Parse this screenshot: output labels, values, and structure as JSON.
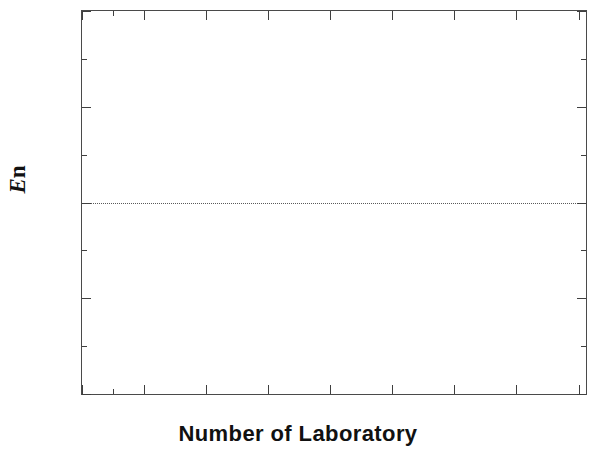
{
  "chart_data": {
    "type": "scatter",
    "title": "",
    "xlabel": "Number of Laboratory",
    "ylabel": "En",
    "ylabel_parts": {
      "italic": "E",
      "upright": "n"
    },
    "x": [
      1,
      2,
      3,
      4,
      5,
      6,
      7,
      8
    ],
    "values": [
      0.33,
      0.76,
      -0.03,
      -0.36,
      0.32,
      -0.35,
      -0.64,
      0.04
    ],
    "series": [
      {
        "name": "En",
        "x": [
          1,
          2,
          3,
          4,
          5,
          6,
          7,
          8
        ],
        "values": [
          0.33,
          0.76,
          -0.03,
          -0.36,
          0.32,
          -0.35,
          -0.64,
          0.04
        ]
      }
    ],
    "xlim": [
      0,
      8.12
    ],
    "ylim": [
      -1.0,
      1.0
    ],
    "xticks": [
      0,
      1,
      2,
      3,
      4,
      5,
      6,
      7,
      8
    ],
    "xtick_labels": [
      "0",
      "1",
      "2",
      "3",
      "4",
      "5",
      "6",
      "7",
      "8"
    ],
    "xminor_step": 0.5,
    "yticks": [
      -1.0,
      -0.5,
      0.0,
      0.5,
      1.0
    ],
    "ytick_labels": [
      "-1.0",
      "-0.5",
      "0.0",
      "0.5",
      "1.0"
    ],
    "yminor_step": 0.25,
    "grid": false,
    "legend": null,
    "legend_position": "none",
    "annotations": [
      {
        "type": "hline",
        "y": 0.0,
        "style": "dotted",
        "color": "#5a5a5a"
      }
    ],
    "marker_style": "filled-square",
    "marker_color": "#0d0d0d",
    "axis_color": "#4a4a4a",
    "background_color": "#ffffff"
  }
}
